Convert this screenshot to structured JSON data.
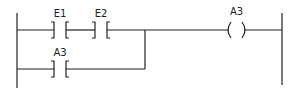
{
  "diagram": {
    "type": "ladder-logic",
    "rung1": {
      "contacts": [
        {
          "label": "E1",
          "type": "normally-open"
        },
        {
          "label": "E2",
          "type": "normally-open"
        }
      ],
      "coil": {
        "label": "A3",
        "type": "output-coil"
      }
    },
    "rung2_branch": {
      "contacts": [
        {
          "label": "A3",
          "type": "normally-open"
        }
      ]
    },
    "colors": {
      "line": "#222222",
      "background": "#ffffff"
    }
  }
}
